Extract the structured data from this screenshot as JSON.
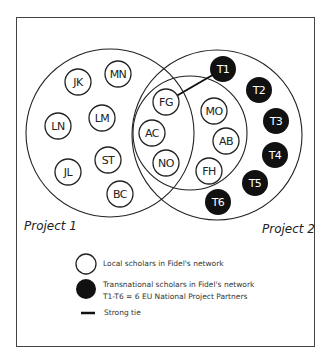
{
  "diagram": {
    "projects": [
      {
        "id": "project-1",
        "label": "Project 1",
        "cx": 110,
        "cy": 133,
        "r": 84
      },
      {
        "id": "project-2",
        "label": "Project 2",
        "cx": 217,
        "cy": 135,
        "r": 85
      }
    ],
    "inner_circle": {
      "cx": 190,
      "cy": 133,
      "r": 57
    },
    "local_scholars": [
      {
        "label": "JK",
        "cx": 78,
        "cy": 82
      },
      {
        "label": "MN",
        "cx": 118,
        "cy": 74
      },
      {
        "label": "LN",
        "cx": 58,
        "cy": 126
      },
      {
        "label": "LM",
        "cx": 102,
        "cy": 118
      },
      {
        "label": "JL",
        "cx": 68,
        "cy": 172
      },
      {
        "label": "ST",
        "cx": 108,
        "cy": 160
      },
      {
        "label": "BC",
        "cx": 120,
        "cy": 194
      },
      {
        "label": "FG",
        "cx": 166,
        "cy": 102
      },
      {
        "label": "AC",
        "cx": 152,
        "cy": 133
      },
      {
        "label": "NO",
        "cx": 166,
        "cy": 163
      },
      {
        "label": "MO",
        "cx": 214,
        "cy": 111
      },
      {
        "label": "AB",
        "cx": 226,
        "cy": 141
      },
      {
        "label": "FH",
        "cx": 209,
        "cy": 171
      }
    ],
    "transnational_scholars": [
      {
        "label": "T1",
        "cx": 223,
        "cy": 69
      },
      {
        "label": "T2",
        "cx": 259,
        "cy": 90
      },
      {
        "label": "T3",
        "cx": 276,
        "cy": 121
      },
      {
        "label": "T4",
        "cx": 275,
        "cy": 155
      },
      {
        "label": "T5",
        "cx": 255,
        "cy": 183
      },
      {
        "label": "T6",
        "cx": 218,
        "cy": 202
      }
    ],
    "strong_ties": [
      {
        "from": "FG",
        "to": "T1"
      }
    ],
    "node_radius": 13
  },
  "legend": {
    "local": "Local scholars in Fidel's network",
    "transnational_line1": "Transnational scholars in Fidel's network",
    "transnational_line2": "T1-T6 = 6 EU National Project Partners",
    "strong_tie": "Strong tie"
  },
  "colors": {
    "stroke": "#222222",
    "filled_node": "#111111",
    "filled_text": "#ffffff",
    "frame": "#444444"
  }
}
